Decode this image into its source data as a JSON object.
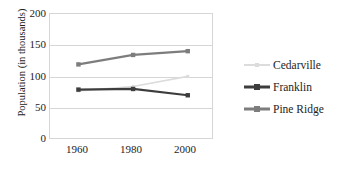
{
  "chart_data": {
    "type": "line",
    "title": "",
    "xlabel": "",
    "ylabel": "Population (in thousands)",
    "categories": [
      "1960",
      "1980",
      "2000"
    ],
    "x": [
      1960,
      1980,
      2000
    ],
    "ylim": [
      0,
      200
    ],
    "yticks": [
      "0",
      "50",
      "100",
      "150",
      "200"
    ],
    "ytick_values": [
      0,
      50,
      100,
      150,
      200
    ],
    "grid": true,
    "legend_position": "right",
    "series": [
      {
        "name": "Cedarville",
        "values": [
          78,
          85,
          101
        ],
        "color": "#dcdcdc"
      },
      {
        "name": "Franklin",
        "values": [
          80,
          81,
          71
        ],
        "color": "#3d3d3d"
      },
      {
        "name": "Pine Ridge",
        "values": [
          120,
          135,
          141
        ],
        "color": "#7d7d7d"
      }
    ]
  },
  "axes": {
    "y_title": "Population (in thousands)",
    "y_labels": [
      "200",
      "150",
      "100",
      "50",
      "0"
    ],
    "x_labels": [
      "1960",
      "1980",
      "2000"
    ]
  },
  "legend": {
    "items": [
      {
        "label": "Cedarville"
      },
      {
        "label": "Franklin"
      },
      {
        "label": "Pine Ridge"
      }
    ]
  }
}
